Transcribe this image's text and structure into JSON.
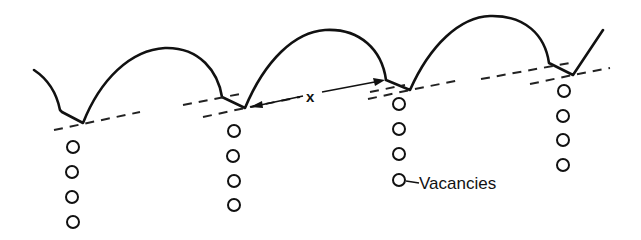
{
  "figure": {
    "labels": {
      "jump_distance": "x",
      "vacancies": "Vacancies"
    },
    "colors": {
      "stroke": "#111111",
      "background": "#ffffff"
    }
  }
}
